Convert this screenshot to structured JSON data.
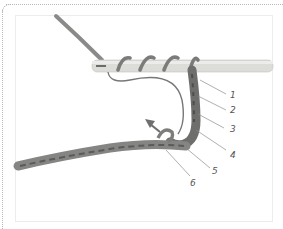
{
  "figure": {
    "callouts": [
      {
        "label": "1"
      },
      {
        "label": "2"
      },
      {
        "label": "3"
      },
      {
        "label": "4"
      },
      {
        "label": "5"
      },
      {
        "label": "6"
      }
    ]
  },
  "colors": {
    "yarn": "#8a8a88",
    "yarn_dark": "#5e5e5c",
    "hook": "#d9d9d6",
    "arrow": "#6f6f70",
    "leader_line": "#8c8c8c",
    "border": "#b8b8b8"
  }
}
